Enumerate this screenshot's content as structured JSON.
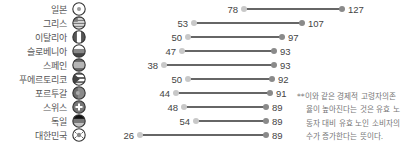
{
  "chart_data": {
    "type": "dumbbell",
    "title": "",
    "xlabel": "",
    "ylabel": "",
    "xlim": [
      26,
      127
    ],
    "grid": false,
    "categories": [
      "일본",
      "그리스",
      "이탈리아",
      "슬로베니아",
      "스페인",
      "푸에르토리코",
      "포르투갈",
      "스위스",
      "독일",
      "대한민국"
    ],
    "flags": [
      "japan-flag",
      "greece-flag",
      "italy-flag",
      "slovenia-flag",
      "spain-flag",
      "puerto-rico-flag",
      "portugal-flag",
      "switzerland-flag",
      "germany-flag",
      "south-korea-flag"
    ],
    "series": [
      {
        "name": "start",
        "values": [
          78,
          53,
          50,
          47,
          38,
          50,
          44,
          48,
          54,
          26
        ]
      },
      {
        "name": "end",
        "values": [
          127,
          107,
          97,
          93,
          93,
          92,
          91,
          89,
          89,
          89
        ]
      }
    ],
    "annotation_lines": [
      "**이와 같은 경제적 고령자의존",
      "율이 높아진다는 것은 유효 노",
      "동자 대비 유효 노인 소비자의",
      "수가 증가한다는 뜻이다."
    ],
    "colors": {
      "start_dot": "#c8c8c8",
      "end_dot": "#8a8a8a",
      "line": "#333333",
      "text": "#555555"
    }
  }
}
